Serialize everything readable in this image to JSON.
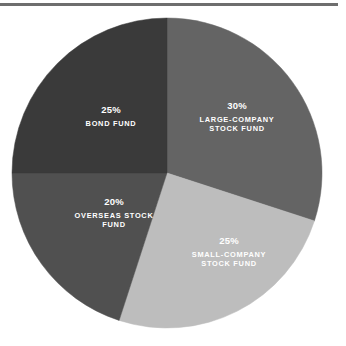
{
  "divider": {
    "name": "top-rule",
    "color": "#6e6e6e"
  },
  "chart_data": {
    "type": "pie",
    "title": "",
    "subtitle": "",
    "xlabel": "",
    "ylabel": "",
    "grid": false,
    "legend": "none",
    "label_position": "inside",
    "start_angle_deg": 0,
    "direction": "clockwise",
    "center": {
      "x": 167,
      "y": 173
    },
    "radius": 155,
    "unit": "%",
    "total": 100,
    "categories": [
      "Large-Company Stock Fund",
      "Small-Company Stock Fund",
      "Overseas Stock Fund",
      "Bond Fund"
    ],
    "values": [
      30,
      25,
      20,
      25
    ],
    "colors": [
      "#646464",
      "#bdbdbd",
      "#505050",
      "#3a3a3a"
    ],
    "slices": [
      {
        "key": "large-company-stock-fund",
        "percent_label": "30%",
        "value": 30,
        "name_lines": [
          "LARGE-COMPANY",
          "STOCK FUND"
        ],
        "color": "#646464",
        "start_deg": 0,
        "end_deg": 108
      },
      {
        "key": "small-company-stock-fund",
        "percent_label": "25%",
        "value": 25,
        "name_lines": [
          "SMALL-COMPANY",
          "STOCK FUND"
        ],
        "color": "#bdbdbd",
        "start_deg": 108,
        "end_deg": 198
      },
      {
        "key": "overseas-stock-fund",
        "percent_label": "20%",
        "value": 20,
        "name_lines": [
          "OVERSEAS STOCK",
          "FUND"
        ],
        "color": "#505050",
        "start_deg": 198,
        "end_deg": 270
      },
      {
        "key": "bond-fund",
        "percent_label": "25%",
        "value": 25,
        "name_lines": [
          "BOND FUND"
        ],
        "color": "#3a3a3a",
        "start_deg": 270,
        "end_deg": 360
      }
    ]
  }
}
